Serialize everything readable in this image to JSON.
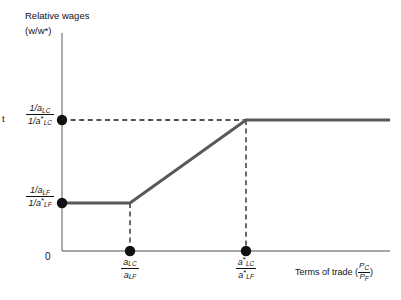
{
  "figure": {
    "margin_letter": "t",
    "origin_label": "0"
  },
  "axes": {
    "y": {
      "title": "Relative wages",
      "units": "(w/w*)",
      "ticks": [
        {
          "id": "y-high",
          "numerator": "1/a",
          "numerator_sub": "LC",
          "denominator": "1/a",
          "denominator_sub": "LC",
          "denominator_star": "*",
          "value_px": 120
        },
        {
          "id": "y-low",
          "numerator": "1/a",
          "numerator_sub": "LF",
          "denominator": "1/a",
          "denominator_sub": "LF",
          "denominator_star": "*",
          "value_px": 203
        }
      ]
    },
    "x": {
      "title": "Terms of trade",
      "title_fraction_num": "P",
      "title_fraction_num_sub": "C",
      "title_fraction_den": "P",
      "title_fraction_den_sub": "F",
      "ticks": [
        {
          "id": "x-low",
          "numerator": "a",
          "numerator_sub": "LC",
          "numerator_star": "",
          "denominator": "a",
          "denominator_sub": "LF",
          "denominator_star": "",
          "value_px": 130
        },
        {
          "id": "x-high",
          "numerator": "a",
          "numerator_sub": "LC",
          "numerator_star": "*",
          "denominator": "a",
          "denominator_sub": "LF",
          "denominator_star": "*",
          "value_px": 246
        }
      ]
    }
  },
  "chart_data": {
    "type": "line",
    "title": "Relative wages",
    "xlabel": "Terms of trade (P_C / P_F)",
    "ylabel": "Relative wages (w/w*)",
    "grid": false,
    "legend": null,
    "axis_pixel_frame": {
      "x_axis_y": 251,
      "y_axis_x": 62,
      "x_axis_right": 390,
      "y_axis_top": 33
    },
    "series": [
      {
        "name": "Relative demand curve",
        "color": "#595959",
        "width_px": 3,
        "points_px": [
          {
            "x": 62,
            "y": 203
          },
          {
            "x": 130,
            "y": 203
          },
          {
            "x": 246,
            "y": 120
          },
          {
            "x": 390,
            "y": 120
          }
        ]
      }
    ],
    "markers": [
      {
        "name": "y-high-dot",
        "x": 62,
        "y": 120,
        "on": "y-axis"
      },
      {
        "name": "y-low-dot",
        "x": 62,
        "y": 203,
        "on": "y-axis"
      },
      {
        "name": "x-low-dot",
        "x": 130,
        "y": 251,
        "on": "x-axis"
      },
      {
        "name": "x-high-dot",
        "x": 246,
        "y": 251,
        "on": "x-axis"
      }
    ],
    "guide_lines": [
      {
        "name": "horizontal-high",
        "x1": 62,
        "y1": 120,
        "x2": 246,
        "y2": 120,
        "style": "dashed"
      },
      {
        "name": "vertical-low",
        "x1": 130,
        "y1": 203,
        "x2": 130,
        "y2": 251,
        "style": "dashed"
      },
      {
        "name": "vertical-high",
        "x1": 246,
        "y1": 120,
        "x2": 246,
        "y2": 251,
        "style": "dashed"
      }
    ]
  },
  "colors": {
    "curve": "#595959",
    "axis": "#8a8a8a",
    "dash": "#1a1a1a",
    "dot": "#111111",
    "text": "#111111",
    "background": "#ffffff"
  }
}
